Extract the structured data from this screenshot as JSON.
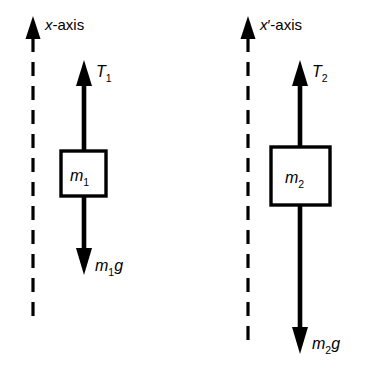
{
  "figure": {
    "background_color": "#ffffff",
    "ink_color": "#000000",
    "width": 367,
    "height": 375
  },
  "diagrams": [
    {
      "id": "left",
      "name": "free-body-diagram-m1",
      "axis": {
        "label_var": "x",
        "label_prime": "",
        "label_suffix": "-axis",
        "line_style": "dashed",
        "direction": "up",
        "x": 33,
        "tip_y": 18,
        "bottom_y": 316
      },
      "tension": {
        "symbol": "T",
        "subscript": "1",
        "direction": "up",
        "shaft_x": 84,
        "tip_y": 62,
        "base_y": 151,
        "label_x": 96,
        "label_y": 76
      },
      "mass": {
        "symbol": "m",
        "subscript": "1",
        "box_x": 61,
        "box_y": 151,
        "box_w": 45,
        "box_h": 45,
        "label_x": 72,
        "label_y": 180
      },
      "weight": {
        "symbol": "m",
        "subscript": "1",
        "factor": "g",
        "direction": "down",
        "shaft_x": 84,
        "top_y": 196,
        "tip_y": 273,
        "label_x": 95,
        "label_y": 270
      }
    },
    {
      "id": "right",
      "name": "free-body-diagram-m2",
      "axis": {
        "label_var": "x",
        "label_prime": "′",
        "label_suffix": "-axis",
        "line_style": "dashed",
        "direction": "up",
        "x": 248,
        "tip_y": 18,
        "bottom_y": 346
      },
      "tension": {
        "symbol": "T",
        "subscript": "2",
        "direction": "up",
        "shaft_x": 300,
        "tip_y": 62,
        "base_y": 147,
        "label_x": 313,
        "label_y": 76
      },
      "mass": {
        "symbol": "m",
        "subscript": "2",
        "box_x": 271,
        "box_y": 147,
        "box_w": 59,
        "box_h": 58,
        "label_x": 287,
        "label_y": 182
      },
      "weight": {
        "symbol": "m",
        "subscript": "2",
        "factor": "g",
        "direction": "down",
        "shaft_x": 300,
        "top_y": 205,
        "tip_y": 352,
        "label_x": 312,
        "label_y": 348
      }
    }
  ]
}
